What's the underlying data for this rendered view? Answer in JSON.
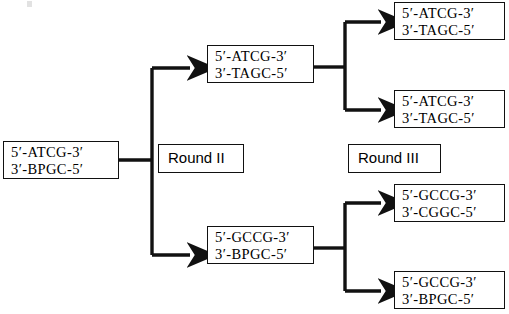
{
  "diagram": {
    "background_color": "#ffffff",
    "line_color": "#111111",
    "boxes": {
      "template": {
        "name": "template-duplex",
        "top_line": "5′-ATCG-3′",
        "bottom_line": "3′-BPGC-5′"
      },
      "round2_top": {
        "name": "round2-top-duplex",
        "top_line": "5′-ATCG-3′",
        "bottom_line": "3′-TAGC-5′"
      },
      "round2_bottom": {
        "name": "round2-bottom-duplex",
        "top_line": "5′-GCCG-3′",
        "bottom_line": "3′-BPGC-5′"
      },
      "round3_a": {
        "name": "round3-duplex-a",
        "top_line": "5′-ATCG-3′",
        "bottom_line": "3′-TAGC-5′"
      },
      "round3_b": {
        "name": "round3-duplex-b",
        "top_line": "5′-ATCG-3′",
        "bottom_line": "3′-TAGC-5′"
      },
      "round3_c": {
        "name": "round3-duplex-c",
        "top_line": "5′-GCCG-3′",
        "bottom_line": "3′-CGGC-5′"
      },
      "round3_d": {
        "name": "round3-duplex-d",
        "top_line": "5′-GCCG-3′",
        "bottom_line": "3′-BPGC-5′"
      }
    },
    "labels": {
      "round2": "Round II",
      "round3": "Round III"
    }
  }
}
